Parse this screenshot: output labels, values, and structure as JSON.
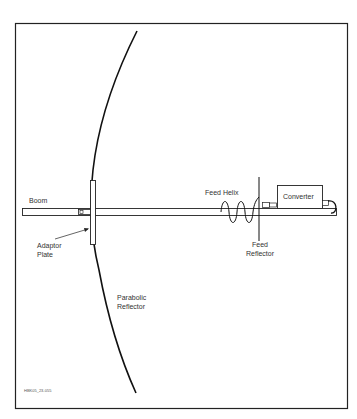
{
  "figure": {
    "id_label": "HBK05_23-055",
    "labels": {
      "boom": "Boom",
      "adaptor_plate": [
        "Adaptor",
        "Plate"
      ],
      "feed_helix": "Feed Helix",
      "converter": "Converter",
      "feed_reflector": [
        "Feed",
        "Reflector"
      ],
      "parabolic_reflector": [
        "Parabolic",
        "Reflector"
      ]
    },
    "colors": {
      "line": "#111111",
      "background": "#ffffff",
      "text": "#333333"
    }
  }
}
